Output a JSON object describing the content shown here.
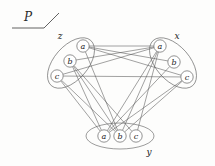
{
  "figure": {
    "corner_label": "P",
    "groups": [
      {
        "id": "z",
        "label": "z",
        "label_pos": {
          "x": 60,
          "y": 36
        },
        "ellipse": {
          "cx": 71,
          "cy": 63,
          "rx": 30,
          "ry": 17,
          "rotate": -49
        },
        "nodes": [
          {
            "id": "z_a",
            "label": "a",
            "x": 83,
            "y": 46,
            "r": 6.2
          },
          {
            "id": "z_b",
            "label": "b",
            "x": 70,
            "y": 61,
            "r": 6.2
          },
          {
            "id": "z_c",
            "label": "c",
            "x": 57,
            "y": 76,
            "r": 6.2
          }
        ]
      },
      {
        "id": "x",
        "label": "x",
        "label_pos": {
          "x": 177,
          "y": 36
        },
        "ellipse": {
          "cx": 173,
          "cy": 63,
          "rx": 30,
          "ry": 17,
          "rotate": 49
        },
        "nodes": [
          {
            "id": "x_a",
            "label": "a",
            "x": 160,
            "y": 46,
            "r": 6.2
          },
          {
            "id": "x_b",
            "label": "b",
            "x": 174,
            "y": 62,
            "r": 6.2
          },
          {
            "id": "x_c",
            "label": "c",
            "x": 187,
            "y": 77,
            "r": 6.2
          }
        ]
      },
      {
        "id": "y",
        "label": "y",
        "label_pos": {
          "x": 149,
          "y": 152
        },
        "ellipse": {
          "cx": 120,
          "cy": 136,
          "rx": 34,
          "ry": 13,
          "rotate": 0
        },
        "nodes": [
          {
            "id": "y_a",
            "label": "a",
            "x": 104,
            "y": 136,
            "r": 6.2
          },
          {
            "id": "y_b",
            "label": "b",
            "x": 120,
            "y": 136,
            "r": 6.2
          },
          {
            "id": "y_c",
            "label": "c",
            "x": 136,
            "y": 136,
            "r": 6.2
          }
        ]
      }
    ],
    "edges": [
      {
        "from": "z_a",
        "to": "x_a"
      },
      {
        "from": "z_a",
        "to": "x_b"
      },
      {
        "from": "z_a",
        "to": "x_c"
      },
      {
        "from": "z_b",
        "to": "x_a"
      },
      {
        "from": "z_c",
        "to": "x_a"
      },
      {
        "from": "z_c",
        "to": "x_c"
      },
      {
        "from": "z_a",
        "to": "y_b"
      },
      {
        "from": "z_b",
        "to": "y_a"
      },
      {
        "from": "z_b",
        "to": "y_b"
      },
      {
        "from": "z_b",
        "to": "y_c"
      },
      {
        "from": "z_c",
        "to": "y_a"
      },
      {
        "from": "z_c",
        "to": "y_b"
      },
      {
        "from": "x_a",
        "to": "y_a"
      },
      {
        "from": "x_a",
        "to": "y_b"
      },
      {
        "from": "x_a",
        "to": "y_c"
      },
      {
        "from": "x_b",
        "to": "y_a"
      },
      {
        "from": "x_c",
        "to": "y_a"
      },
      {
        "from": "x_c",
        "to": "y_b"
      }
    ],
    "corner_marks": {
      "underline": {
        "x1": 12,
        "y1": 28,
        "x2": 44,
        "y2": 28
      },
      "slash": {
        "x1": 44,
        "y1": 28,
        "x2": 59,
        "y2": 13
      }
    }
  }
}
